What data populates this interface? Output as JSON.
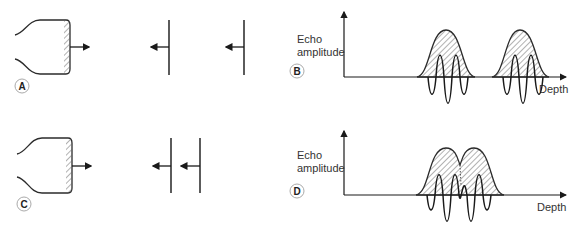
{
  "figure": {
    "panels": [
      {
        "id": "A",
        "label": "A",
        "type": "transducer-reflectors",
        "reflector_count": 2,
        "reflector_spacing": "wide"
      },
      {
        "id": "B",
        "label": "B",
        "type": "echo-plot",
        "ylabel": [
          "Echo",
          "amplitude"
        ],
        "xlabel": "Depth",
        "echo_count": 2,
        "overlap": false
      },
      {
        "id": "C",
        "label": "C",
        "type": "transducer-reflectors",
        "reflector_count": 2,
        "reflector_spacing": "close"
      },
      {
        "id": "D",
        "label": "D",
        "type": "echo-plot",
        "ylabel": [
          "Echo",
          "amplitude"
        ],
        "xlabel": "Depth",
        "echo_count": 2,
        "overlap": true
      }
    ],
    "colors": {
      "stroke": "#2b2b2b",
      "hatch": "#555555",
      "axis": "#1a1a1a",
      "label_circle": "#aaaaaa"
    }
  }
}
